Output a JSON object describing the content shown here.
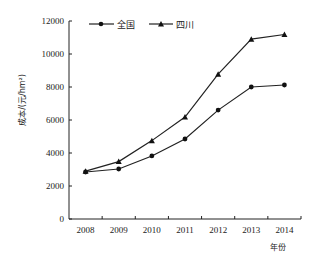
{
  "chart_data": {
    "type": "line",
    "title": "",
    "xlabel": "年份",
    "ylabel": "成本/(元/hm²)",
    "categories": [
      "2008",
      "2009",
      "2010",
      "2011",
      "2012",
      "2013",
      "2014"
    ],
    "series": [
      {
        "name": "全国",
        "marker": "circle",
        "values": [
          2850,
          3030,
          3820,
          4850,
          6600,
          8000,
          8120
        ]
      },
      {
        "name": "四川",
        "marker": "triangle",
        "values": [
          2900,
          3480,
          4750,
          6180,
          8780,
          10900,
          11180
        ]
      }
    ],
    "yticks": [
      "0",
      "2000",
      "4000",
      "6000",
      "8000",
      "10000",
      "12000"
    ],
    "ylim": [
      0,
      12000
    ],
    "grid": false,
    "legend_position": "top"
  }
}
